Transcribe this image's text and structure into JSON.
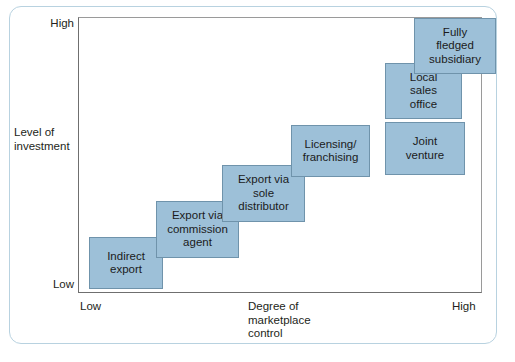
{
  "figure": {
    "frame_color": "#b8d2e0",
    "box_fill": "#9dc0d8",
    "box_border": "#6f93ab",
    "axis_color": "#6f6f6f"
  },
  "axes": {
    "y": {
      "title": "Level of\ninvestment",
      "high_label": "High",
      "low_label": "Low"
    },
    "x": {
      "title": "Degree of\nmarketplace\ncontrol",
      "low_label": "Low",
      "high_label": "High"
    }
  },
  "chart_data": {
    "type": "scatter",
    "xlabel": "Degree of marketplace control",
    "ylabel": "Level of investment",
    "xlim": [
      "Low",
      "High"
    ],
    "ylim": [
      "Low",
      "High"
    ],
    "grid": false,
    "legend": null,
    "categories": [
      "Indirect export",
      "Export via commission agent",
      "Export via sole distributor",
      "Licensing/ franchising",
      "Joint venture",
      "Local sales office",
      "Fully fledged subsidiary"
    ],
    "steps": [
      {
        "label": "Indirect\nexport",
        "rank": 1,
        "x_pct": 5,
        "y_pct": 8
      },
      {
        "label": "Export via\ncommission\nagent",
        "rank": 2,
        "x_pct": 22,
        "y_pct": 22
      },
      {
        "label": "Export via\nsole\ndistributor",
        "rank": 3,
        "x_pct": 38,
        "y_pct": 40
      },
      {
        "label": "Licensing/\nfranchising",
        "rank": 4,
        "x_pct": 55,
        "y_pct": 56
      },
      {
        "label": "Joint\nventure",
        "rank": 5,
        "x_pct": 78,
        "y_pct": 56
      },
      {
        "label": "Local\nsales\noffice",
        "rank": 6,
        "x_pct": 78,
        "y_pct": 76
      },
      {
        "label": "Fully\nfledged\nsubsidiary",
        "rank": 7,
        "x_pct": 90,
        "y_pct": 93
      }
    ]
  },
  "boxes": [
    {
      "name": "indirect-export",
      "label": "Indirect\nexport",
      "left": 89,
      "top": 237,
      "width": 74,
      "height": 52
    },
    {
      "name": "export-via-commission-agent",
      "label": "Export via\ncommission\nagent",
      "left": 156,
      "top": 201,
      "width": 83,
      "height": 57
    },
    {
      "name": "export-via-sole-distributor",
      "label": "Export via\nsole\ndistributor",
      "left": 222,
      "top": 165,
      "width": 83,
      "height": 57
    },
    {
      "name": "licensing-franchising",
      "label": "Licensing/\nfranchising",
      "left": 291,
      "top": 125,
      "width": 79,
      "height": 52
    },
    {
      "name": "joint-venture",
      "label": "Joint\nventure",
      "left": 385,
      "top": 122,
      "width": 80,
      "height": 53
    },
    {
      "name": "local-sales-office",
      "label": "Local\nsales\noffice",
      "left": 385,
      "top": 63,
      "width": 77,
      "height": 56
    },
    {
      "name": "fully-fledged-subsidiary",
      "label": "Fully\nfledged\nsubsidiary",
      "left": 414,
      "top": 18,
      "width": 82,
      "height": 56
    }
  ]
}
